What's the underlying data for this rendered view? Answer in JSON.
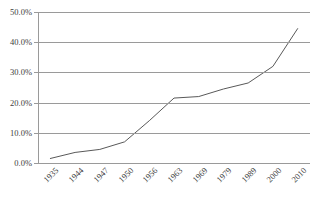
{
  "chart_data": {
    "type": "line",
    "title": "",
    "title_truncated": true,
    "xlabel": "",
    "ylabel": "",
    "categories": [
      "1935",
      "1944",
      "1947",
      "1950",
      "1956",
      "1963",
      "1969",
      "1979",
      "1989",
      "2000",
      "2010"
    ],
    "values": [
      1.5,
      3.5,
      4.5,
      7.0,
      14.0,
      21.5,
      22.0,
      24.5,
      26.5,
      32.0,
      44.5
    ],
    "series": [
      {
        "name": "",
        "values": [
          1.5,
          3.5,
          4.5,
          7.0,
          14.0,
          21.5,
          22.0,
          24.5,
          26.5,
          32.0,
          44.5
        ]
      }
    ],
    "ylim": [
      0,
      50
    ],
    "ytick_values": [
      0,
      10,
      20,
      30,
      40,
      50
    ],
    "ytick_labels": [
      "0.0%",
      "10.0%",
      "20.0%",
      "30.0%",
      "40.0%",
      "50.0%"
    ],
    "grid": true,
    "grid_axis": "y",
    "legend": false,
    "legend_position": "none",
    "markers": false,
    "line_color": "#595959",
    "grid_color": "#9a9a9a",
    "axis_color": "#9a9a9a",
    "background_color": "#ffffff",
    "text_color": "#3d3d3d",
    "xtick_rotation": -45
  }
}
